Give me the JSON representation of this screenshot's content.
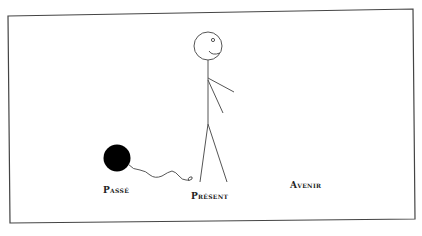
{
  "header_fragment": "",
  "labels": {
    "past": "Passé",
    "present": "Présent",
    "future": "Avenir"
  },
  "colors": {
    "frame_stroke": "#444444",
    "figure_stroke": "#555555",
    "ball_fill": "#000000",
    "background": "#ffffff"
  },
  "figure": {
    "position": "present"
  },
  "ball_and_chain": {
    "description": "ball-and-chain-attached-to-figure",
    "position": "past"
  }
}
